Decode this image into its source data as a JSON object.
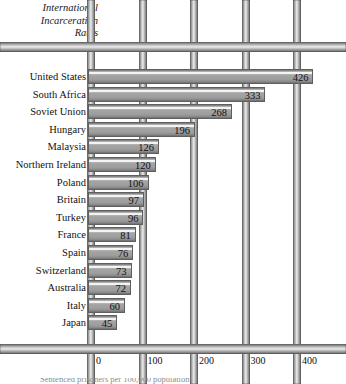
{
  "chart_data": {
    "type": "bar",
    "orientation": "horizontal",
    "title": "International Incarceration Rates",
    "title_lines": [
      "International",
      "Incarceration",
      "Rates"
    ],
    "xlabel": "",
    "ylabel": "",
    "xlim": [
      0,
      426
    ],
    "axis_max_tick": 400,
    "grid": false,
    "legend": null,
    "theme": "prison-bars",
    "categories": [
      "United States",
      "South Africa",
      "Soviet Union",
      "Hungary",
      "Malaysia",
      "Northern Ireland",
      "Poland",
      "Britain",
      "Turkey",
      "France",
      "Spain",
      "Switzerland",
      "Australia",
      "Italy",
      "Japan"
    ],
    "values": [
      426,
      333,
      268,
      196,
      126,
      120,
      106,
      97,
      96,
      81,
      76,
      73,
      72,
      60,
      45
    ],
    "tick_values": [
      0,
      100,
      200,
      300,
      400
    ],
    "tick_labels": [
      "0",
      "100",
      "200",
      "300",
      "400"
    ],
    "caption": "Sentenced prisoners per 100,000 population"
  },
  "colors": {
    "bar_face": "#9d9d9d",
    "bar_highlight": "#fbfbfb",
    "bar_edge": "#5f5f5f",
    "background": "#ffffff",
    "text": "#111111"
  }
}
